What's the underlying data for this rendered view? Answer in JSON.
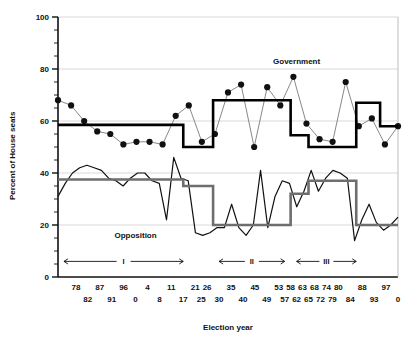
{
  "chart_data": {
    "type": "line",
    "title": "",
    "xlabel": "Election year",
    "ylabel": "Percent of House seats",
    "ylim": [
      0,
      100
    ],
    "ytick_values": [
      0,
      20,
      40,
      60,
      80,
      100
    ],
    "ytick_labels": [
      "0",
      "20",
      "40",
      "60",
      "80",
      "100"
    ],
    "yminor_step": 5,
    "grid": "horizontal-major",
    "legend_position": "inline-annotation",
    "xtick_labels_row1": [
      "78",
      "87",
      "96",
      "4",
      "11",
      "21",
      "26",
      "35",
      "45",
      "53",
      "58",
      "63",
      "68",
      "74",
      "80",
      "88",
      "97"
    ],
    "xtick_labels_row2": [
      "82",
      "91",
      "0",
      "8",
      "17",
      "25",
      "30",
      "40",
      "49",
      "57",
      "62",
      "65",
      "72",
      "79",
      "84",
      "93",
      "0"
    ],
    "xtick_row1_positions": [
      3,
      7,
      11,
      15,
      19,
      23,
      25,
      29,
      33,
      37,
      39,
      41,
      43,
      45,
      47,
      51,
      55
    ],
    "xtick_row2_positions": [
      5,
      9,
      13,
      17,
      21,
      24,
      27,
      31,
      35,
      38,
      40,
      42,
      44,
      46,
      49,
      53,
      57
    ],
    "n_elections": 58,
    "annotations": [
      {
        "name": "government-label",
        "text": "Government",
        "x": 40,
        "y": 82
      },
      {
        "name": "opposition-label",
        "text": "Opposition",
        "x": 13,
        "y": 15
      }
    ],
    "periods": [
      {
        "label": "I",
        "x_start": 1,
        "x_end": 21
      },
      {
        "label": "II",
        "x_start": 27,
        "x_end": 38
      },
      {
        "label": "III",
        "x_start": 40,
        "x_end": 50
      }
    ],
    "period_bar_y": 6,
    "series": [
      {
        "name": "Government",
        "style": "markers-line",
        "color": "#7a7a7a",
        "marker_color": "#111111",
        "values": [
          68,
          66,
          60,
          56,
          55,
          51,
          52,
          52,
          51,
          62,
          66,
          52,
          55,
          71,
          74,
          50,
          73,
          66,
          77,
          59,
          53,
          52,
          75,
          58,
          61,
          51,
          58
        ]
      },
      {
        "name": "Government mean (step)",
        "style": "step",
        "color": "#000000",
        "steps": [
          {
            "x_start": 0,
            "x_end": 21,
            "value": 58.5
          },
          {
            "x_start": 21,
            "x_end": 26,
            "value": 50
          },
          {
            "x_start": 26,
            "x_end": 39,
            "value": 68
          },
          {
            "x_start": 39,
            "x_end": 42,
            "value": 54.5
          },
          {
            "x_start": 42,
            "x_end": 50,
            "value": 50
          },
          {
            "x_start": 50,
            "x_end": 54,
            "value": 67
          },
          {
            "x_start": 54,
            "x_end": 58,
            "value": 58
          }
        ]
      },
      {
        "name": "Opposition",
        "style": "line",
        "color": "#111111",
        "values": [
          31,
          36,
          40,
          42,
          43,
          42,
          41,
          38,
          37,
          35,
          38,
          40,
          40,
          37,
          36,
          22,
          46,
          38,
          37,
          17,
          16,
          17,
          19,
          19,
          28,
          19,
          16,
          20,
          41,
          19,
          31,
          37,
          36,
          27,
          33,
          41,
          33,
          38,
          41,
          40,
          38,
          14,
          22,
          28,
          21,
          18,
          20,
          23
        ]
      },
      {
        "name": "Opposition mean (step)",
        "style": "step",
        "color": "#6e6e6e",
        "steps": [
          {
            "x_start": 0,
            "x_end": 21,
            "value": 37.5
          },
          {
            "x_start": 21,
            "x_end": 26,
            "value": 35
          },
          {
            "x_start": 26,
            "x_end": 39,
            "value": 20
          },
          {
            "x_start": 39,
            "x_end": 42,
            "value": 32
          },
          {
            "x_start": 42,
            "x_end": 50,
            "value": 37
          },
          {
            "x_start": 50,
            "x_end": 58,
            "value": 20
          }
        ]
      }
    ]
  }
}
